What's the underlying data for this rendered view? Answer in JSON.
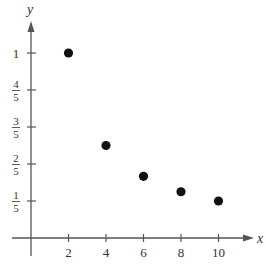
{
  "chart_data": {
    "type": "scatter",
    "title": "",
    "xlabel": "x",
    "ylabel": "y",
    "xlim": [
      0,
      12
    ],
    "ylim": [
      0,
      1.2
    ],
    "grid": false,
    "x_ticks": [
      {
        "value": 2,
        "label": "2"
      },
      {
        "value": 4,
        "label": "4"
      },
      {
        "value": 6,
        "label": "6"
      },
      {
        "value": 8,
        "label": "8"
      },
      {
        "value": 10,
        "label": "10"
      }
    ],
    "y_ticks": [
      {
        "value": 0.2,
        "num": "1",
        "den": "5"
      },
      {
        "value": 0.4,
        "num": "2",
        "den": "5"
      },
      {
        "value": 0.6,
        "num": "3",
        "den": "5"
      },
      {
        "value": 0.8,
        "num": "4",
        "den": "5"
      },
      {
        "value": 1.0,
        "num": "1",
        "den": ""
      }
    ],
    "points": [
      {
        "x": 2,
        "y": 1.0
      },
      {
        "x": 4,
        "y": 0.5
      },
      {
        "x": 6,
        "y": 0.3333
      },
      {
        "x": 8,
        "y": 0.25
      },
      {
        "x": 10,
        "y": 0.2
      }
    ]
  }
}
